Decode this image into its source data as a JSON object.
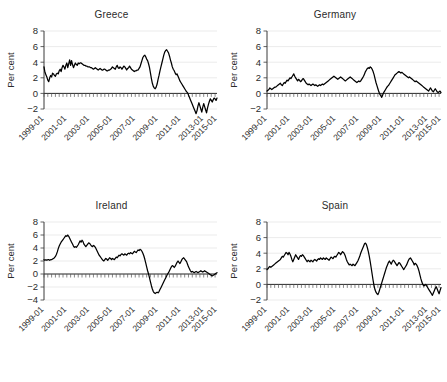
{
  "figure": {
    "ylabel": "Per cent",
    "xtick_labels": [
      "1999-01",
      "2001-01",
      "2003-01",
      "2005-01",
      "2007-01",
      "2009-01",
      "2011-01",
      "2013-01",
      "2015-01"
    ],
    "line_color": "#000000",
    "grid_color": "#e6e6e6",
    "axis_color": "#3a3a3a"
  },
  "chart_data": [
    {
      "type": "line",
      "title": "Greece",
      "xlabel": "",
      "ylabel": "Per cent",
      "ylim": [
        -2,
        8
      ],
      "yticks": [
        -2,
        0,
        2,
        4,
        6,
        8
      ],
      "xlim": [
        "1999-01",
        "2016-06"
      ],
      "xticks": [
        "1999-01",
        "2001-01",
        "2003-01",
        "2005-01",
        "2007-01",
        "2009-01",
        "2011-01",
        "2013-01",
        "2015-01"
      ],
      "grid": true,
      "legend": "none",
      "x_start": "1999-01",
      "x_step_months": 1,
      "values": [
        3.4,
        2.7,
        2.4,
        2.1,
        1.7,
        1.5,
        2.0,
        2.3,
        2.1,
        2.6,
        2.5,
        2.3,
        2.2,
        2.5,
        2.6,
        2.5,
        2.9,
        3.1,
        2.8,
        3.3,
        3.6,
        3.4,
        3.1,
        3.6,
        3.9,
        3.3,
        3.8,
        4.3,
        3.6,
        4.2,
        3.7,
        3.3,
        3.6,
        3.9,
        3.7,
        3.6,
        3.9,
        3.8,
        3.9,
        3.9,
        3.8,
        3.7,
        3.6,
        3.6,
        3.5,
        3.5,
        3.4,
        3.4,
        3.4,
        3.3,
        3.3,
        3.2,
        3.1,
        3.2,
        3.3,
        3.2,
        3.1,
        3.0,
        3.1,
        3.2,
        3.1,
        3.0,
        3.0,
        3.1,
        3.1,
        3.0,
        2.9,
        2.9,
        3.0,
        3.0,
        3.1,
        3.2,
        3.4,
        3.3,
        3.2,
        3.1,
        3.4,
        3.6,
        3.3,
        3.2,
        3.4,
        3.3,
        3.1,
        3.3,
        3.5,
        3.4,
        3.2,
        3.0,
        3.2,
        3.3,
        3.5,
        3.3,
        3.1,
        3.0,
        2.9,
        2.8,
        2.9,
        2.9,
        3.0,
        3.0,
        3.2,
        3.4,
        3.8,
        4.2,
        4.6,
        4.8,
        4.9,
        4.7,
        4.4,
        4.2,
        3.8,
        3.3,
        2.6,
        1.9,
        1.3,
        0.9,
        0.7,
        0.6,
        0.8,
        1.2,
        1.8,
        2.3,
        2.9,
        3.4,
        3.9,
        4.4,
        4.9,
        5.3,
        5.5,
        5.6,
        5.4,
        5.2,
        4.8,
        4.3,
        3.9,
        3.4,
        3.1,
        2.9,
        2.6,
        2.4,
        2.5,
        2.2,
        1.9,
        1.6,
        1.4,
        1.2,
        1.0,
        0.8,
        0.6,
        0.4,
        0.2,
        0.1,
        -0.2,
        -0.5,
        -0.8,
        -1.1,
        -1.4,
        -1.7,
        -2.0,
        -2.3,
        -2.6,
        -2.2,
        -1.6,
        -1.2,
        -1.6,
        -2.0,
        -2.4,
        -1.8,
        -1.3,
        -1.7,
        -2.1,
        -2.5,
        -1.9,
        -1.4,
        -1.0,
        -0.7,
        -0.9,
        -1.1,
        -0.8,
        -0.6,
        -0.7,
        -0.9,
        -0.6
      ]
    },
    {
      "type": "line",
      "title": "Germany",
      "xlabel": "",
      "ylabel": "Per cent",
      "ylim": [
        -2,
        8
      ],
      "yticks": [
        -2,
        0,
        2,
        4,
        6,
        8
      ],
      "xlim": [
        "1999-01",
        "2016-06"
      ],
      "xticks": [
        "1999-01",
        "2001-01",
        "2003-01",
        "2005-01",
        "2007-01",
        "2009-01",
        "2011-01",
        "2013-01",
        "2015-01"
      ],
      "grid": true,
      "legend": "none",
      "x_start": "1999-01",
      "x_step_months": 1,
      "values": [
        0.3,
        0.4,
        0.5,
        0.7,
        0.6,
        0.5,
        0.6,
        0.7,
        0.8,
        0.8,
        0.9,
        1.0,
        1.1,
        1.2,
        1.3,
        1.1,
        1.0,
        1.2,
        1.4,
        1.3,
        1.5,
        1.7,
        1.6,
        1.8,
        2.0,
        1.9,
        2.1,
        2.3,
        2.5,
        2.2,
        2.0,
        1.8,
        1.6,
        1.8,
        1.7,
        1.5,
        1.6,
        1.8,
        1.9,
        1.7,
        1.5,
        1.3,
        1.2,
        1.1,
        1.2,
        1.1,
        1.0,
        1.1,
        1.2,
        1.1,
        1.0,
        1.1,
        1.0,
        0.9,
        1.0,
        1.1,
        1.0,
        1.1,
        1.2,
        1.1,
        1.2,
        1.3,
        1.4,
        1.5,
        1.6,
        1.7,
        1.8,
        1.9,
        2.0,
        2.1,
        2.2,
        2.1,
        2.0,
        1.9,
        1.8,
        1.9,
        2.0,
        2.1,
        2.0,
        1.9,
        1.8,
        1.7,
        1.6,
        1.7,
        1.8,
        1.9,
        2.0,
        2.1,
        2.0,
        1.9,
        1.8,
        1.7,
        1.6,
        1.5,
        1.4,
        1.5,
        1.6,
        1.5,
        1.6,
        1.8,
        2.0,
        2.2,
        2.5,
        2.8,
        3.0,
        3.2,
        3.3,
        3.2,
        3.4,
        3.3,
        3.1,
        2.8,
        2.4,
        1.9,
        1.4,
        1.0,
        0.6,
        0.2,
        -0.1,
        -0.3,
        -0.5,
        -0.2,
        0.1,
        0.3,
        0.5,
        0.7,
        0.9,
        1.0,
        1.2,
        1.4,
        1.6,
        1.8,
        2.0,
        2.2,
        2.4,
        2.5,
        2.6,
        2.7,
        2.8,
        2.7,
        2.6,
        2.7,
        2.6,
        2.5,
        2.4,
        2.3,
        2.2,
        2.1,
        2.0,
        2.1,
        2.0,
        1.9,
        1.8,
        1.7,
        1.6,
        1.5,
        1.6,
        1.5,
        1.4,
        1.3,
        1.2,
        1.1,
        1.0,
        0.9,
        0.8,
        0.7,
        0.6,
        0.5,
        0.4,
        0.3,
        0.5,
        0.7,
        0.5,
        0.3,
        0.2,
        0.4,
        0.6,
        0.4,
        0.2,
        0.1,
        0.2,
        0.3,
        0.1
      ]
    },
    {
      "type": "line",
      "title": "Ireland",
      "xlabel": "",
      "ylabel": "Per cent",
      "ylim": [
        -4,
        8
      ],
      "yticks": [
        -4,
        -2,
        0,
        2,
        4,
        6,
        8
      ],
      "xlim": [
        "1999-01",
        "2016-06"
      ],
      "xticks": [
        "1999-01",
        "2001-01",
        "2003-01",
        "2005-01",
        "2007-01",
        "2009-01",
        "2011-01",
        "2013-01",
        "2015-01"
      ],
      "grid": true,
      "legend": "none",
      "x_start": "1999-01",
      "x_step_months": 1,
      "values": [
        2.2,
        2.1,
        2.2,
        2.1,
        2.2,
        2.2,
        2.1,
        2.2,
        2.2,
        2.3,
        2.4,
        2.5,
        2.7,
        3.0,
        3.4,
        3.9,
        4.3,
        4.6,
        4.9,
        5.1,
        5.3,
        5.5,
        5.7,
        5.9,
        5.8,
        6.0,
        5.8,
        5.5,
        5.2,
        4.9,
        4.6,
        4.3,
        4.1,
        4.2,
        4.1,
        4.3,
        4.5,
        4.8,
        5.1,
        4.9,
        5.2,
        5.0,
        4.6,
        4.4,
        4.2,
        4.4,
        4.6,
        4.8,
        4.7,
        4.5,
        4.3,
        4.2,
        4.4,
        4.3,
        4.1,
        3.8,
        3.5,
        3.2,
        2.9,
        2.7,
        2.5,
        2.3,
        2.1,
        2.0,
        2.2,
        2.4,
        2.3,
        2.1,
        2.3,
        2.5,
        2.4,
        2.2,
        2.4,
        2.3,
        2.2,
        2.4,
        2.6,
        2.5,
        2.7,
        2.9,
        2.8,
        3.0,
        3.1,
        3.0,
        2.9,
        3.1,
        3.0,
        2.9,
        3.1,
        3.2,
        3.1,
        3.3,
        3.2,
        3.1,
        3.3,
        3.5,
        3.4,
        3.3,
        3.5,
        3.7,
        3.6,
        3.8,
        3.7,
        3.5,
        3.2,
        2.8,
        2.3,
        1.7,
        1.1,
        0.5,
        0.0,
        -0.6,
        -1.2,
        -1.8,
        -2.3,
        -2.7,
        -2.9,
        -3.0,
        -2.9,
        -2.8,
        -2.9,
        -2.7,
        -2.4,
        -2.1,
        -1.8,
        -1.5,
        -1.2,
        -0.9,
        -0.6,
        -0.3,
        0.0,
        0.2,
        0.5,
        0.8,
        1.1,
        1.3,
        1.2,
        1.0,
        1.2,
        1.5,
        1.8,
        2.0,
        1.8,
        1.6,
        1.9,
        2.2,
        2.4,
        2.5,
        2.3,
        2.1,
        1.9,
        1.5,
        1.1,
        0.8,
        0.5,
        0.3,
        0.4,
        0.3,
        0.2,
        0.3,
        0.4,
        0.3,
        0.2,
        0.3,
        0.4,
        0.5,
        0.4,
        0.3,
        0.4,
        0.5,
        0.4,
        0.3,
        0.2,
        0.1,
        0.0,
        -0.1,
        -0.2,
        -0.3,
        -0.2,
        -0.1,
        0.0,
        0.1,
        0.2
      ]
    },
    {
      "type": "line",
      "title": "Spain",
      "xlabel": "",
      "ylabel": "Per cent",
      "ylim": [
        -2,
        8
      ],
      "yticks": [
        -2,
        0,
        2,
        4,
        6,
        8
      ],
      "xlim": [
        "1999-01",
        "2016-06"
      ],
      "xticks": [
        "1999-01",
        "2001-01",
        "2003-01",
        "2005-01",
        "2007-01",
        "2009-01",
        "2011-01",
        "2013-01",
        "2015-01"
      ],
      "grid": true,
      "legend": "none",
      "x_start": "1999-01",
      "x_step_months": 1,
      "values": [
        1.9,
        2.0,
        2.2,
        2.3,
        2.2,
        2.3,
        2.4,
        2.5,
        2.6,
        2.7,
        2.8,
        2.9,
        3.0,
        3.1,
        3.2,
        3.4,
        3.6,
        3.5,
        3.7,
        3.9,
        4.1,
        4.0,
        3.8,
        4.1,
        3.9,
        3.6,
        3.2,
        2.9,
        3.2,
        3.5,
        3.8,
        3.6,
        3.4,
        3.2,
        3.5,
        3.7,
        3.6,
        3.8,
        3.7,
        3.5,
        3.3,
        3.1,
        2.9,
        3.1,
        3.0,
        2.9,
        3.1,
        3.0,
        2.9,
        3.1,
        3.2,
        3.1,
        3.0,
        3.2,
        3.3,
        3.2,
        3.4,
        3.3,
        3.2,
        3.4,
        3.3,
        3.2,
        3.4,
        3.3,
        3.2,
        3.1,
        3.3,
        3.5,
        3.4,
        3.3,
        3.5,
        3.6,
        3.5,
        3.7,
        3.9,
        4.1,
        4.0,
        3.8,
        4.0,
        4.2,
        4.1,
        3.9,
        3.6,
        3.2,
        2.9,
        2.7,
        2.5,
        2.6,
        2.5,
        2.4,
        2.6,
        2.5,
        2.4,
        2.6,
        2.8,
        3.0,
        3.3,
        3.6,
        4.0,
        4.3,
        4.6,
        4.9,
        5.2,
        5.3,
        5.1,
        4.7,
        4.2,
        3.6,
        2.9,
        2.1,
        1.3,
        0.5,
        -0.2,
        -0.7,
        -1.0,
        -1.2,
        -1.3,
        -1.0,
        -0.6,
        -0.2,
        0.2,
        0.6,
        1.0,
        1.4,
        1.8,
        2.2,
        2.5,
        2.8,
        3.0,
        2.8,
        2.6,
        2.9,
        3.1,
        3.0,
        2.8,
        2.6,
        2.4,
        2.6,
        2.8,
        2.7,
        2.5,
        2.3,
        2.1,
        1.9,
        2.1,
        2.3,
        2.5,
        2.8,
        3.1,
        3.3,
        3.4,
        3.2,
        3.0,
        2.8,
        2.5,
        2.7,
        2.6,
        2.4,
        2.1,
        1.7,
        1.2,
        0.7,
        0.3,
        0.0,
        -0.2,
        -0.1,
        0.0,
        -0.2,
        -0.4,
        -0.6,
        -0.8,
        -1.0,
        -1.2,
        -1.4,
        -1.1,
        -0.8,
        -0.5,
        -0.3,
        -0.6,
        -0.9,
        -1.2,
        -0.8,
        -0.4
      ]
    }
  ]
}
